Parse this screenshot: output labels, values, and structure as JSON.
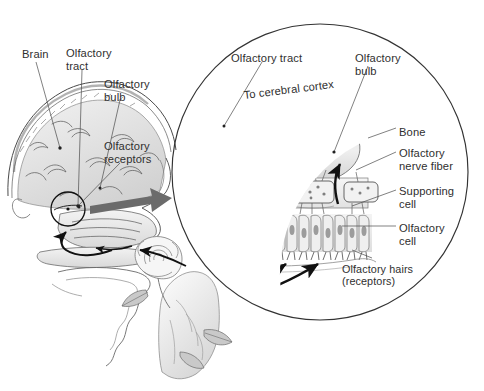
{
  "figure": {
    "background_color": "#ffffff",
    "ink_color": "#2f2f2f",
    "accent_arrow_color": "#6b6b6b"
  },
  "head_labels": [
    {
      "key": "brain",
      "text": "Brain",
      "x": 22,
      "y": 48
    },
    {
      "key": "olfactory_tract",
      "text": "Olfactory\ntract",
      "x": 66,
      "y": 47
    },
    {
      "key": "olfactory_bulb",
      "text": "Olfactory\nbulb",
      "x": 104,
      "y": 78
    },
    {
      "key": "olfactory_receptors",
      "text": "Olfactory\nreceptors",
      "x": 104,
      "y": 140
    }
  ],
  "inset_labels": [
    {
      "key": "olfactory_tract_inset",
      "text": "Olfactory tract",
      "x": 231,
      "y": 52
    },
    {
      "key": "to_cerebral_cortex",
      "text": "To cerebral cortex",
      "x": 243,
      "y": 89,
      "rotated": true
    },
    {
      "key": "olfactory_bulb_inset",
      "text": "Olfactory\nbulb",
      "x": 355,
      "y": 52
    },
    {
      "key": "bone",
      "text": "Bone",
      "x": 399,
      "y": 126
    },
    {
      "key": "olfactory_nerve_fiber",
      "text": "Olfactory\nnerve fiber",
      "x": 399,
      "y": 147
    },
    {
      "key": "supporting_cell",
      "text": "Supporting\ncell",
      "x": 399,
      "y": 185
    },
    {
      "key": "olfactory_cell",
      "text": "Olfactory\ncell",
      "x": 399,
      "y": 222
    },
    {
      "key": "olfactory_hairs",
      "text": "Olfactory hairs\n(receptors)",
      "x": 342,
      "y": 263
    }
  ],
  "inset_circle": {
    "cx": 320,
    "cy": 172,
    "r": 148
  },
  "magnifier_circle": {
    "cx": 68,
    "cy": 209,
    "r": 17
  },
  "callout_arrow": {
    "from_x": 92,
    "from_y": 205,
    "to_x": 170,
    "to_y": 190
  },
  "flow_arrows": {
    "tract_direction_count": 3,
    "receptor_to_bulb_count": 3,
    "nerve_bundles_count": 3
  },
  "structures": [
    "cerebral hemisphere",
    "olfactory bulb",
    "olfactory tract",
    "cribriform plate / bone",
    "olfactory nerve fibers",
    "supporting cells",
    "olfactory cells",
    "olfactory hairs",
    "nasal cavity",
    "tongue and oral cavity",
    "rose held in hand"
  ]
}
